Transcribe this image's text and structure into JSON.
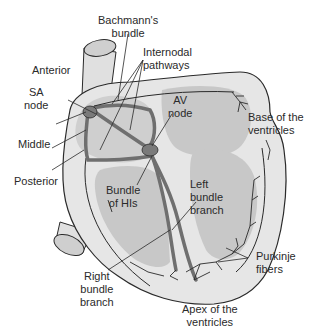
{
  "colors": {
    "background": "#ffffff",
    "outline": "#2a2a2a",
    "heart_wall": "#e3e3e3",
    "chamber": "#c8c8c8",
    "conduction": "#7d7d7d",
    "label_text": "#2a2a2a"
  },
  "labels": {
    "bachmanns_bundle": [
      "Bachmann's",
      "bundle"
    ],
    "internodal_pathways": [
      "Internodal",
      "pathways"
    ],
    "anterior": "Anterior",
    "sa_node": [
      "SA",
      "node"
    ],
    "av_node": [
      "AV",
      "node"
    ],
    "middle": "Middle",
    "posterior": "Posterior",
    "base_of_ventricles": [
      "Base of the",
      "ventricles"
    ],
    "bundle_of_his": [
      "Bundle",
      "of HIs"
    ],
    "left_bundle_branch": [
      "Left",
      "bundle",
      "branch"
    ],
    "right_bundle_branch": [
      "Right",
      "bundle",
      "branch"
    ],
    "purkinje_fibers": [
      "Purkinje",
      "fibers"
    ],
    "apex_of_ventricles": [
      "Apex of the",
      "ventricles"
    ]
  }
}
